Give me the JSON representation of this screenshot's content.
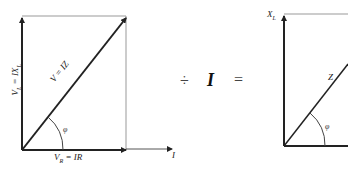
{
  "left_diagram": {
    "vertical_label": "V_L = IX_L",
    "vertical_label_main": "V",
    "vertical_label_sub": "L",
    "vertical_label_rest": " = IX",
    "vertical_label_sub2": "L",
    "hypotenuse_label": "V = IZ",
    "horizontal_label_main": "V",
    "horizontal_label_sub": "R",
    "horizontal_label_rest": " = IR",
    "angle_label": "φ",
    "axis_label": "I"
  },
  "operator": {
    "divide": "÷",
    "divisor": "I",
    "equals": "="
  },
  "right_diagram": {
    "vertical_label_main": "X",
    "vertical_label_sub": "L",
    "hypotenuse_label": "Z",
    "angle_label": "φ"
  },
  "colors": {
    "line": "#222222",
    "thin_line": "#aaaaaa"
  }
}
